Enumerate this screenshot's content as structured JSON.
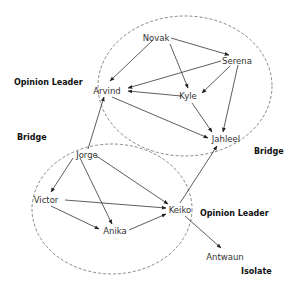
{
  "diagram": {
    "type": "social-network",
    "groups": [
      {
        "id": "upper-group",
        "cx": 185,
        "cy": 86,
        "rx": 87,
        "ry": 70
      },
      {
        "id": "lower-group",
        "cx": 112,
        "cy": 209,
        "rx": 80,
        "ry": 65
      }
    ],
    "nodes": [
      {
        "id": "novak",
        "label": "Novak",
        "x": 156,
        "y": 38
      },
      {
        "id": "serena",
        "label": "Serena",
        "x": 237,
        "y": 61
      },
      {
        "id": "arvind",
        "label": "Arvind",
        "x": 107,
        "y": 91
      },
      {
        "id": "kyle",
        "label": "Kyle",
        "x": 188,
        "y": 96
      },
      {
        "id": "jahleel",
        "label": "Jahleel",
        "x": 226,
        "y": 139
      },
      {
        "id": "jorge",
        "label": "Jorge",
        "x": 87,
        "y": 155
      },
      {
        "id": "victor",
        "label": "Victor",
        "x": 46,
        "y": 200
      },
      {
        "id": "keiko",
        "label": "Keiko",
        "x": 180,
        "y": 210
      },
      {
        "id": "anika",
        "label": "Anika",
        "x": 115,
        "y": 231
      },
      {
        "id": "antwaun",
        "label": "Antwaun",
        "x": 225,
        "y": 257
      }
    ],
    "edges": [
      {
        "from": "novak",
        "to": "serena",
        "x1": 171,
        "y1": 38,
        "x2": 229,
        "y2": 55
      },
      {
        "from": "novak",
        "to": "arvind",
        "x1": 153,
        "y1": 40,
        "x2": 110,
        "y2": 81
      },
      {
        "from": "novak",
        "to": "kyle",
        "x1": 170,
        "y1": 44,
        "x2": 188,
        "y2": 88
      },
      {
        "from": "serena",
        "to": "arvind",
        "x1": 221,
        "y1": 61,
        "x2": 128,
        "y2": 88
      },
      {
        "from": "serena",
        "to": "kyle",
        "x1": 230,
        "y1": 66,
        "x2": 202,
        "y2": 93
      },
      {
        "from": "serena",
        "to": "jahleel",
        "x1": 238,
        "y1": 65,
        "x2": 223,
        "y2": 132
      },
      {
        "from": "kyle",
        "to": "arvind",
        "x1": 181,
        "y1": 96,
        "x2": 128,
        "y2": 91
      },
      {
        "from": "kyle",
        "to": "jahleel",
        "x1": 192,
        "y1": 103,
        "x2": 212,
        "y2": 132
      },
      {
        "from": "arvind",
        "to": "jahleel",
        "x1": 112,
        "y1": 97,
        "x2": 208,
        "y2": 138
      },
      {
        "from": "jorge",
        "to": "arvind",
        "x1": 88,
        "y1": 149,
        "x2": 104,
        "y2": 97
      },
      {
        "from": "jorge",
        "to": "victor",
        "x1": 73,
        "y1": 158,
        "x2": 51,
        "y2": 192
      },
      {
        "from": "jorge",
        "to": "anika",
        "x1": 80,
        "y1": 158,
        "x2": 112,
        "y2": 224
      },
      {
        "from": "jorge",
        "to": "keiko",
        "x1": 95,
        "y1": 155,
        "x2": 168,
        "y2": 204
      },
      {
        "from": "victor",
        "to": "keiko",
        "x1": 65,
        "y1": 200,
        "x2": 166,
        "y2": 208
      },
      {
        "from": "victor",
        "to": "anika",
        "x1": 51,
        "y1": 206,
        "x2": 99,
        "y2": 229
      },
      {
        "from": "anika",
        "to": "keiko",
        "x1": 129,
        "y1": 230,
        "x2": 166,
        "y2": 214
      },
      {
        "from": "keiko",
        "to": "jahleel",
        "x1": 180,
        "y1": 203,
        "x2": 217,
        "y2": 146
      },
      {
        "from": "keiko",
        "to": "antwaun",
        "x1": 185,
        "y1": 216,
        "x2": 221,
        "y2": 248
      }
    ],
    "role_labels": [
      {
        "id": "opinion-leader-upper",
        "text": "Opinion Leader",
        "x": 14,
        "y": 85
      },
      {
        "id": "bridge-left",
        "text": "Bridge",
        "x": 17,
        "y": 140
      },
      {
        "id": "bridge-right",
        "text": "Bridge",
        "x": 254,
        "y": 154
      },
      {
        "id": "opinion-leader-lower",
        "text": "Opinion Leader",
        "x": 200,
        "y": 216
      },
      {
        "id": "isolate",
        "text": "Isolate",
        "x": 241,
        "y": 274
      }
    ],
    "colors": {
      "line": "#333333",
      "text": "#333333",
      "label": "#111111",
      "background": "#ffffff"
    }
  }
}
